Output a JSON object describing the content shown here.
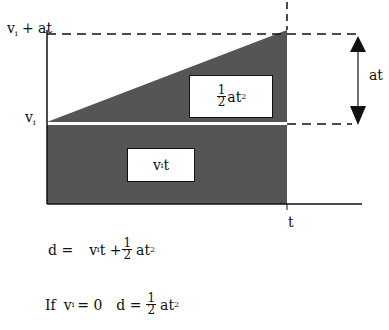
{
  "diagram": {
    "colors": {
      "fill": "#555555",
      "line": "#111111",
      "gap": "#ffffff"
    },
    "axis_labels": {
      "y_top": {
        "base": "v",
        "sub": "i",
        "rest": " + at"
      },
      "y_mid": {
        "base": "v",
        "sub": "i"
      },
      "x": "t"
    },
    "regions": {
      "triangle": {
        "frac_n": "1",
        "frac_d": "2",
        "text": "at",
        "sup": "2"
      },
      "rectangle": {
        "base": "v",
        "sub": "i",
        "rest": "t"
      }
    },
    "arrow_label": "at",
    "equations": [
      {
        "lhs": "d =",
        "t1_base": "v",
        "t1_sub": "i",
        "t1_rest": "t +",
        "frac_n": "1",
        "frac_d": "2",
        "tail": "at",
        "sup": "2"
      },
      {
        "prefix": "If",
        "cond_base": "v",
        "cond_sub": "i",
        "cond_rest": "= 0",
        "lhs": "d =",
        "frac_n": "1",
        "frac_d": "2",
        "tail": "at",
        "sup": "2"
      }
    ]
  }
}
